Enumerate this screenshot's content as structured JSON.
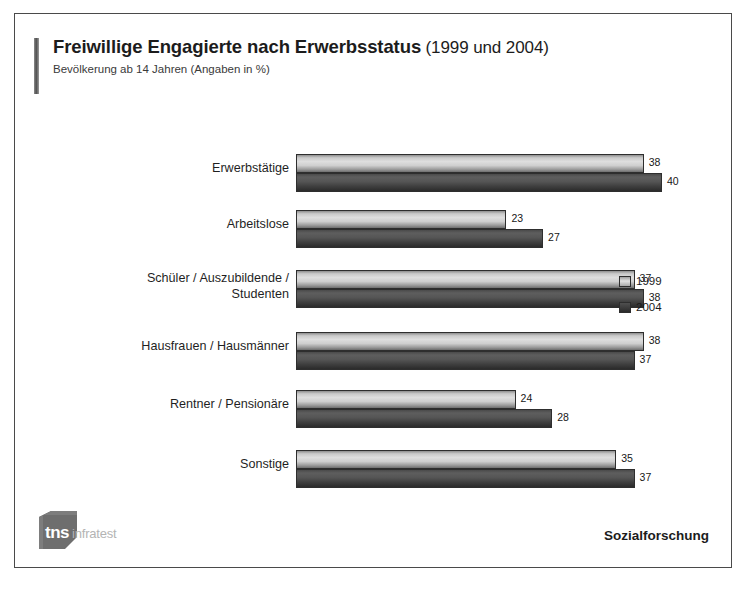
{
  "header": {
    "title_main": "Freiwillige Engagierte nach Erwerbsstatus",
    "title_years": "(1999 und 2004)",
    "subtitle": "Bevölkerung ab 14 Jahren (Angaben in %)"
  },
  "footer": {
    "logo_tns": "tns",
    "logo_infratest": "infratest",
    "right_label": "Sozialforschung"
  },
  "legend": {
    "items": [
      {
        "label": "1999",
        "color": "#dedede",
        "swatch": "legend-swatch-1999"
      },
      {
        "label": "2004",
        "color": "#3a3a3a",
        "swatch": "legend-swatch-2004"
      }
    ]
  },
  "chart_data": {
    "type": "bar",
    "orientation": "horizontal",
    "title": "Freiwillige Engagierte nach Erwerbsstatus (1999 und 2004)",
    "subtitle": "Bevölkerung ab 14 Jahren (Angaben in %)",
    "xlabel": "",
    "ylabel": "",
    "unit": "%",
    "grid": false,
    "legend_position": "right",
    "xlim": [
      0,
      40
    ],
    "categories": [
      "Erwerbstätige",
      "Arbeitslose",
      "Schüler / Auszubildende /\nStudenten",
      "Hausfrauen / Hausmänner",
      "Rentner / Pensionäre",
      "Sonstige"
    ],
    "series": [
      {
        "name": "1999",
        "color": "#dedede",
        "values": [
          38,
          23,
          37,
          38,
          24,
          35
        ]
      },
      {
        "name": "2004",
        "color": "#3a3a3a",
        "values": [
          40,
          27,
          38,
          37,
          28,
          37
        ]
      }
    ]
  }
}
